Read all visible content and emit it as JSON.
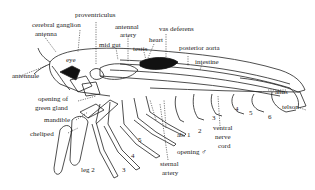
{
  "diagram": {
    "labels": {
      "proventriculus": "proventriculus",
      "cerebral_ganglion": "cerebral ganglion",
      "antenna": "antenna",
      "antennal_artery_1": "antennal",
      "antennal_artery_2": "artery",
      "mid_gut": "mid gut",
      "testis": "testis",
      "heart": "heart",
      "vas_deferens": "vas deferens",
      "posterior_aorta": "posterior aorta",
      "intestine": "intestine",
      "eye": "eye",
      "antennule": "antennule",
      "anus": "anus",
      "telson": "telson",
      "opening_green_gland_1": "opening of",
      "opening_green_gland_2": "green gland",
      "mandible": "mandible",
      "cheliped": "cheliped",
      "leg2": "leg 2",
      "leg3": "3",
      "leg4": "4",
      "leg5": "5",
      "ab1": "ab. 1",
      "ab2": "2",
      "ab3": "3",
      "ab4": "4",
      "ab5": "5",
      "ab6": "6",
      "ventral_nerve_1": "ventral",
      "ventral_nerve_2": "nerve",
      "ventral_nerve_3": "cord",
      "opening_male": "opening ♂",
      "sternal_artery_1": "sternal",
      "sternal_artery_2": "artery"
    },
    "colors": {
      "ink": "#222222",
      "background": "#ffffff",
      "organ_fill": "#111111"
    }
  }
}
